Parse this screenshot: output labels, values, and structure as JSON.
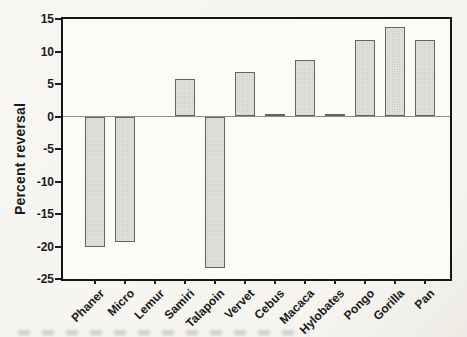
{
  "chart_data": {
    "type": "bar",
    "title": "",
    "xlabel": "",
    "ylabel": "Percent reversal",
    "categories": [
      "Phaner",
      "Micro",
      "Lemur",
      "Samiri",
      "Talapoin",
      "Vervet",
      "Cebus",
      "Macaca",
      "Hylobates",
      "Pongo",
      "Gorilla",
      "Pan"
    ],
    "values": [
      -20,
      -19.3,
      0,
      5.8,
      -23.3,
      6.8,
      0.4,
      8.7,
      0.4,
      11.7,
      13.7,
      11.8
    ],
    "ylim": [
      -25,
      15
    ],
    "yticks": [
      15,
      10,
      5,
      0,
      -5,
      -10,
      -15,
      -20,
      -25
    ],
    "grid": false,
    "legend": "none",
    "x_tick_label_rotation": -45,
    "colors": {
      "bar_fill": "#e0dfd9",
      "bar_stipple": "#bdbcb5",
      "bar_border": "#636361",
      "frame": "#161614",
      "zero_line": "#8f8e8a",
      "text": "#1a1a1a",
      "paper": "#f5f4ef"
    }
  }
}
